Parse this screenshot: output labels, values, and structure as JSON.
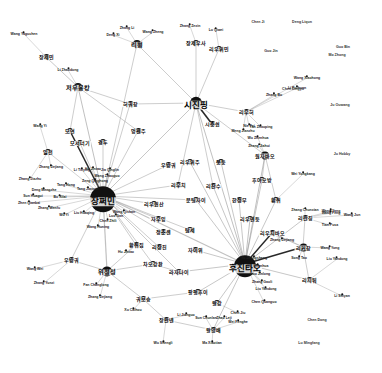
{
  "figure": {
    "type": "network-graph",
    "title": "",
    "background_color": "#ffffff",
    "node_color": "#111111",
    "edge_color": "#9a9a9a",
    "strong_edge_color": "#111111",
    "width": 382,
    "height": 373
  },
  "nodes": [
    {
      "id": "jiang_zemin",
      "label": "장쩌민",
      "x": 103,
      "y": 196,
      "r": 13,
      "tier": "hub"
    },
    {
      "id": "hu_jintao",
      "label": "후진타오",
      "x": 245,
      "y": 264,
      "r": 11,
      "tier": "hub"
    },
    {
      "id": "xi_jinping",
      "label": "시진핑",
      "x": 196,
      "y": 103,
      "r": 6,
      "tier": "hub"
    },
    {
      "id": "zhou_yongkang",
      "label": "저우융캉",
      "x": 78,
      "y": 87,
      "r": 4,
      "tier": "mid"
    },
    {
      "id": "yu_zhengsheng",
      "label": "위정성",
      "x": 107,
      "y": 271,
      "r": 5,
      "tier": "mid"
    },
    {
      "id": "li_peng",
      "label": "리펑",
      "x": 137,
      "y": 44,
      "r": 4,
      "tier": "mid"
    },
    {
      "id": "zhang_jiemin",
      "label": "장제민",
      "x": 46,
      "y": 57,
      "r": 3,
      "tier": "small"
    },
    {
      "id": "jang_jeo_usa",
      "label": "장제우사",
      "x": 196,
      "y": 43,
      "r": 3,
      "tier": "small"
    },
    {
      "id": "liu_yumin",
      "label": "리우위민",
      "x": 219,
      "y": 49,
      "r": 3,
      "tier": "small"
    },
    {
      "id": "heo_gwochang",
      "label": "허궈창",
      "x": 130,
      "y": 104,
      "r": 3,
      "tier": "small"
    },
    {
      "id": "meng_jianzhu",
      "label": "멍젠주",
      "x": 138,
      "y": 131,
      "r": 3,
      "tier": "small"
    },
    {
      "id": "liu_yunhe",
      "label": "리우허",
      "x": 246,
      "y": 112,
      "r": 3,
      "tier": "small"
    },
    {
      "id": "xi_zhongxun",
      "label": "시중쉰",
      "x": 212,
      "y": 124,
      "r": 3,
      "tier": "small"
    },
    {
      "id": "wu_bangguo_c",
      "label": "우방궈",
      "x": 168,
      "y": 165,
      "r": 3,
      "tier": "small"
    },
    {
      "id": "liu_yuzhou",
      "label": "리우위주",
      "x": 190,
      "y": 162,
      "r": 3,
      "tier": "small"
    },
    {
      "id": "jong_dong",
      "label": "쭝둥",
      "x": 221,
      "y": 162,
      "r": 3,
      "tier": "small"
    },
    {
      "id": "wen_jiabao",
      "label": "원자바오",
      "x": 265,
      "y": 155,
      "r": 4,
      "tier": "small"
    },
    {
      "id": "liu_qi",
      "label": "리우치",
      "x": 178,
      "y": 185,
      "r": 3,
      "tier": "small"
    },
    {
      "id": "li_zhanshu",
      "label": "리잔수",
      "x": 213,
      "y": 186,
      "r": 3,
      "tier": "small"
    },
    {
      "id": "hu_yaobang",
      "label": "후야오방",
      "x": 262,
      "y": 180,
      "r": 3,
      "tier": "small"
    },
    {
      "id": "han_zhengbu",
      "label": "한정부",
      "x": 239,
      "y": 200,
      "r": 3,
      "tier": "small"
    },
    {
      "id": "huang_ju_r",
      "label": "황쥐",
      "x": 276,
      "y": 200,
      "r": 3,
      "tier": "small"
    },
    {
      "id": "wen_tingjai",
      "label": "문팅자이",
      "x": 196,
      "y": 200,
      "r": 3,
      "tier": "small"
    },
    {
      "id": "liu_yunshan_l",
      "label": "리우윈산",
      "x": 154,
      "y": 204,
      "r": 3,
      "tier": "small"
    },
    {
      "id": "ja_uyang",
      "label": "자우잉",
      "x": 158,
      "y": 219,
      "r": 3,
      "tier": "small"
    },
    {
      "id": "liu_yandong",
      "label": "리우옌둥",
      "x": 250,
      "y": 219,
      "r": 3,
      "tier": "small"
    },
    {
      "id": "li_lanqing",
      "label": "리란칭",
      "x": 305,
      "y": 218,
      "r": 3,
      "tier": "small"
    },
    {
      "id": "liu_qibao",
      "label": "리우치바오",
      "x": 272,
      "y": 233,
      "r": 3,
      "tier": "small"
    },
    {
      "id": "li_keqiang",
      "label": "리커창",
      "x": 303,
      "y": 247,
      "r": 4,
      "tier": "small"
    },
    {
      "id": "jeong_chunsaeng",
      "label": "정춘셴",
      "x": 163,
      "y": 232,
      "r": 3,
      "tier": "small"
    },
    {
      "id": "dang_se",
      "label": "탐세",
      "x": 190,
      "y": 230,
      "r": 3,
      "tier": "small"
    },
    {
      "id": "li_jangchin",
      "label": "리장친",
      "x": 159,
      "y": 247,
      "r": 3,
      "tier": "small"
    },
    {
      "id": "ja_ieo",
      "label": "자이위",
      "x": 195,
      "y": 250,
      "r": 3,
      "tier": "small"
    },
    {
      "id": "huang_ju_jip",
      "label": "황쥐집",
      "x": 136,
      "y": 245,
      "r": 3,
      "tier": "small"
    },
    {
      "id": "wu_bangwei",
      "label": "우방궈",
      "x": 71,
      "y": 260,
      "r": 3,
      "tier": "small"
    },
    {
      "id": "jao_gangchuan",
      "label": "차오강촨",
      "x": 153,
      "y": 264,
      "r": 3,
      "tier": "small"
    },
    {
      "id": "lajanai",
      "label": "라자나이",
      "x": 179,
      "y": 272,
      "r": 3,
      "tier": "small"
    },
    {
      "id": "li_jitao",
      "label": "리지퉈",
      "x": 309,
      "y": 280,
      "r": 3,
      "tier": "small"
    },
    {
      "id": "guo_boxiong",
      "label": "궈보슝",
      "x": 143,
      "y": 299,
      "r": 3,
      "tier": "small"
    },
    {
      "id": "fang_fenghui",
      "label": "팡펑후이",
      "x": 198,
      "y": 292,
      "r": 3,
      "tier": "small"
    },
    {
      "id": "wang_gang",
      "label": "왕강",
      "x": 217,
      "y": 303,
      "r": 3,
      "tier": "small"
    },
    {
      "id": "zhang_wannian",
      "label": "장완녠",
      "x": 166,
      "y": 320,
      "r": 3,
      "tier": "small"
    },
    {
      "id": "wang_yangbae",
      "label": "왕양배",
      "x": 213,
      "y": 330,
      "r": 3,
      "tier": "small"
    },
    {
      "id": "il_cheon",
      "label": "일천",
      "x": 48,
      "y": 152,
      "r": 3,
      "tier": "small"
    },
    {
      "id": "moyeon",
      "label": "모연",
      "x": 70,
      "y": 131,
      "r": 3,
      "tier": "small"
    },
    {
      "id": "moseoneogi",
      "label": "모서너기",
      "x": 80,
      "y": 143,
      "r": 3,
      "tier": "small"
    },
    {
      "id": "gyeongdu",
      "label": "경두",
      "x": 103,
      "y": 142,
      "r": 3,
      "tier": "small"
    }
  ],
  "leaf_labels": [
    {
      "label": "Wang Yaguchen",
      "x": 24,
      "y": 34
    },
    {
      "label": "Li Zhaodong",
      "x": 68,
      "y": 70
    },
    {
      "label": "Wang Yi",
      "x": 40,
      "y": 126
    },
    {
      "label": "Zhang Dejiang",
      "x": 51,
      "y": 167
    },
    {
      "label": "Zhang Jiazhu",
      "x": 30,
      "y": 179
    },
    {
      "label": "Tang Hong",
      "x": 66,
      "y": 185
    },
    {
      "label": "Deng Mengzhe",
      "x": 44,
      "y": 190
    },
    {
      "label": "Sun Huagui",
      "x": 33,
      "y": 196
    },
    {
      "label": "Zhen Qianbai",
      "x": 29,
      "y": 203
    },
    {
      "label": "Bo Xilai",
      "x": 60,
      "y": 197
    },
    {
      "label": "Zhang Wenfu",
      "x": 49,
      "y": 208
    },
    {
      "label": "Wu Yi",
      "x": 64,
      "y": 215
    },
    {
      "label": "Liu Huaqing",
      "x": 84,
      "y": 213
    },
    {
      "label": "Tang Jiaxuan",
      "x": 88,
      "y": 189
    },
    {
      "label": "Zeng Qinghong",
      "x": 95,
      "y": 181
    },
    {
      "label": "Hu Jintao",
      "x": 93,
      "y": 169
    },
    {
      "label": "Li Tieying",
      "x": 82,
      "y": 170
    },
    {
      "label": "Wang Zhaoguo",
      "x": 107,
      "y": 176
    },
    {
      "label": "Jia Qinglin",
      "x": 110,
      "y": 170
    },
    {
      "label": "Chen Zhili",
      "x": 108,
      "y": 221
    },
    {
      "label": "Wang Huning",
      "x": 98,
      "y": 227
    },
    {
      "label": "Luo Gan",
      "x": 116,
      "y": 216
    },
    {
      "label": "Wang Qishan",
      "x": 124,
      "y": 212
    },
    {
      "label": "Hu Jintao",
      "x": 126,
      "y": 252
    },
    {
      "label": "Wang Wei",
      "x": 35,
      "y": 269
    },
    {
      "label": "Zhang Yunzi",
      "x": 44,
      "y": 283
    },
    {
      "label": "Fan Changlong",
      "x": 96,
      "y": 285
    },
    {
      "label": "Zhang Dejiang",
      "x": 100,
      "y": 297
    },
    {
      "label": "Xu Caihou",
      "x": 133,
      "y": 310
    },
    {
      "label": "Wu Shengli",
      "x": 163,
      "y": 343
    },
    {
      "label": "Ma Xiaotian",
      "x": 212,
      "y": 343
    },
    {
      "label": "Wei Fenghe",
      "x": 238,
      "y": 322
    },
    {
      "label": "Chen Jiu",
      "x": 238,
      "y": 313
    },
    {
      "label": "Zhao Leji",
      "x": 224,
      "y": 318
    },
    {
      "label": "Sun Chunlan",
      "x": 206,
      "y": 318
    },
    {
      "label": "Li Jianguo",
      "x": 186,
      "y": 315
    },
    {
      "label": "Chen Quanguo",
      "x": 264,
      "y": 302
    },
    {
      "label": "Liu Yandong",
      "x": 266,
      "y": 289
    },
    {
      "label": "Zhang Gaoli",
      "x": 262,
      "y": 282
    },
    {
      "label": "Guo Jinlong",
      "x": 260,
      "y": 274
    },
    {
      "label": "Hu Chunhua",
      "x": 258,
      "y": 266
    },
    {
      "label": "Yu Zhengsheng",
      "x": 254,
      "y": 258
    },
    {
      "label": "Zhang Dejiang",
      "x": 282,
      "y": 240
    },
    {
      "label": "Zhang Chunxian",
      "x": 305,
      "y": 210
    },
    {
      "label": "Wang Yang",
      "x": 331,
      "y": 211
    },
    {
      "label": "Meng Jianzhu",
      "x": 243,
      "y": 131
    },
    {
      "label": "Wu Zhenhua",
      "x": 258,
      "y": 138
    },
    {
      "label": "Zhang Jiahui",
      "x": 259,
      "y": 146
    },
    {
      "label": "Nie Fei",
      "x": 249,
      "y": 126
    },
    {
      "label": "Yan Zhaoping",
      "x": 261,
      "y": 127
    },
    {
      "label": "Wei Yongkang",
      "x": 303,
      "y": 174
    },
    {
      "label": "Wang Yong",
      "x": 330,
      "y": 248
    },
    {
      "label": "Liu Yandong",
      "x": 337,
      "y": 259
    },
    {
      "label": "Wang Feng",
      "x": 331,
      "y": 213
    },
    {
      "label": "Wang Jun",
      "x": 352,
      "y": 215
    },
    {
      "label": "Tian Pusa",
      "x": 330,
      "y": 225
    },
    {
      "label": "Li Shiyan",
      "x": 342,
      "y": 296
    },
    {
      "label": "Song Tao",
      "x": 299,
      "y": 258
    },
    {
      "label": "Zhang Bo",
      "x": 274,
      "y": 95
    },
    {
      "label": "Zhang Zexin",
      "x": 190,
      "y": 26
    },
    {
      "label": "Zhang Li",
      "x": 127,
      "y": 28
    },
    {
      "label": "Deng Xi",
      "x": 113,
      "y": 35
    },
    {
      "label": "Wang Zheng",
      "x": 153,
      "y": 32
    },
    {
      "label": "Lu Qiwei",
      "x": 216,
      "y": 30
    },
    {
      "label": "Wang Xiaohong",
      "x": 307,
      "y": 78
    },
    {
      "label": "Li Ruihuan",
      "x": 297,
      "y": 88
    }
  ],
  "isolated_nodes": [
    {
      "label": "Chen Ji",
      "x": 258,
      "y": 23
    },
    {
      "label": "Deng Liqun",
      "x": 302,
      "y": 23
    },
    {
      "label": "Guo Jin",
      "x": 271,
      "y": 52
    },
    {
      "label": "Chen Lingyu",
      "x": 293,
      "y": 90
    },
    {
      "label": "Ju Ouwang",
      "x": 340,
      "y": 106
    },
    {
      "label": "Ju Hobby",
      "x": 342,
      "y": 155
    },
    {
      "label": "Chen Dong",
      "x": 317,
      "y": 321
    },
    {
      "label": "Lu Mingfang",
      "x": 309,
      "y": 344
    },
    {
      "label": "Guo Bin",
      "x": 343,
      "y": 48
    },
    {
      "label": "Mo Zhong",
      "x": 337,
      "y": 56
    }
  ],
  "edges": [
    {
      "from": "jiang_zemin",
      "to": "hu_jintao",
      "w": 1.1
    },
    {
      "from": "jiang_zemin",
      "to": "xi_jinping",
      "w": 0.9
    },
    {
      "from": "jiang_zemin",
      "to": "zhou_yongkang",
      "w": 1
    },
    {
      "from": "jiang_zemin",
      "to": "yu_zhengsheng",
      "w": 1.2
    },
    {
      "from": "jiang_zemin",
      "to": "heo_gwochang",
      "w": 0.8
    },
    {
      "from": "jiang_zemin",
      "to": "meng_jianzhu",
      "w": 0.8
    },
    {
      "from": "jiang_zemin",
      "to": "li_peng",
      "w": 0.8
    },
    {
      "from": "jiang_zemin",
      "to": "gyeongdu",
      "w": 0.8
    },
    {
      "from": "jiang_zemin",
      "to": "moseoneogi",
      "w": 0.8
    },
    {
      "from": "jiang_zemin",
      "to": "moyeon",
      "w": 1.5
    },
    {
      "from": "jiang_zemin",
      "to": "il_cheon",
      "w": 0.7
    },
    {
      "from": "jiang_zemin",
      "to": "wu_bangguo_c",
      "w": 0.8
    },
    {
      "from": "jiang_zemin",
      "to": "liu_qi",
      "w": 0.8
    },
    {
      "from": "jiang_zemin",
      "to": "liu_yunshan_l",
      "w": 0.8
    },
    {
      "from": "jiang_zemin",
      "to": "ja_uyang",
      "w": 0.8
    },
    {
      "from": "jiang_zemin",
      "to": "jeong_chunsaeng",
      "w": 0.8
    },
    {
      "from": "jiang_zemin",
      "to": "li_jangchin",
      "w": 0.8
    },
    {
      "from": "jiang_zemin",
      "to": "huang_ju_jip",
      "w": 0.8
    },
    {
      "from": "jiang_zemin",
      "to": "jao_gangchuan",
      "w": 0.8
    },
    {
      "from": "jiang_zemin",
      "to": "wen_tingjai",
      "w": 0.8
    },
    {
      "from": "jiang_zemin",
      "to": "dang_se",
      "w": 0.8
    },
    {
      "from": "jiang_zemin",
      "to": "lajanai",
      "w": 0.8
    },
    {
      "from": "jiang_zemin",
      "to": "wu_bangwei",
      "w": 0.8
    },
    {
      "from": "hu_jintao",
      "to": "xi_jinping",
      "w": 1
    },
    {
      "from": "hu_jintao",
      "to": "wen_jiabao",
      "w": 1
    },
    {
      "from": "hu_jintao",
      "to": "hu_yaobang",
      "w": 0.9
    },
    {
      "from": "hu_jintao",
      "to": "han_zhengbu",
      "w": 0.9
    },
    {
      "from": "hu_jintao",
      "to": "huang_ju_r",
      "w": 0.9
    },
    {
      "from": "hu_jintao",
      "to": "liu_yandong",
      "w": 1
    },
    {
      "from": "hu_jintao",
      "to": "liu_qibao",
      "w": 1.4
    },
    {
      "from": "hu_jintao",
      "to": "li_keqiang",
      "w": 1.4
    },
    {
      "from": "hu_jintao",
      "to": "li_lanqing",
      "w": 0.9
    },
    {
      "from": "hu_jintao",
      "to": "li_zhanshu",
      "w": 0.9
    },
    {
      "from": "hu_jintao",
      "to": "jong_dong",
      "w": 0.9
    },
    {
      "from": "hu_jintao",
      "to": "liu_yuzhou",
      "w": 0.9
    },
    {
      "from": "hu_jintao",
      "to": "wen_tingjai",
      "w": 0.9
    },
    {
      "from": "hu_jintao",
      "to": "ja_ieo",
      "w": 0.9
    },
    {
      "from": "hu_jintao",
      "to": "wang_gang",
      "w": 0.9
    },
    {
      "from": "hu_jintao",
      "to": "fang_fenghui",
      "w": 0.9
    },
    {
      "from": "hu_jintao",
      "to": "li_jitao",
      "w": 0.9
    },
    {
      "from": "hu_jintao",
      "to": "wang_yangbae",
      "w": 0.9
    },
    {
      "from": "hu_jintao",
      "to": "lajanai",
      "w": 0.9
    },
    {
      "from": "xi_jinping",
      "to": "xi_zhongxun",
      "w": 1.6
    },
    {
      "from": "xi_jinping",
      "to": "liu_yunhe",
      "w": 0.8
    },
    {
      "from": "xi_jinping",
      "to": "jang_jeo_usa",
      "w": 0.8
    },
    {
      "from": "xi_jinping",
      "to": "liu_yumin",
      "w": 0.8
    },
    {
      "from": "xi_jinping",
      "to": "li_peng",
      "w": 0.8
    },
    {
      "from": "xi_jinping",
      "to": "heo_gwochang",
      "w": 0.8
    },
    {
      "from": "xi_jinping",
      "to": "wen_jiabao",
      "w": 0.8
    },
    {
      "from": "xi_jinping",
      "to": "liu_qi",
      "w": 0.8
    },
    {
      "from": "xi_jinping",
      "to": "li_zhanshu",
      "w": 0.8
    },
    {
      "from": "zhou_yongkang",
      "to": "zhang_jiemin",
      "w": 0.9
    },
    {
      "from": "zhou_yongkang",
      "to": "heo_gwochang",
      "w": 0.8
    },
    {
      "from": "zhou_yongkang",
      "to": "meng_jianzhu",
      "w": 0.8
    },
    {
      "from": "zhou_yongkang",
      "to": "moyeon",
      "w": 0.8
    },
    {
      "from": "yu_zhengsheng",
      "to": "huang_ju_jip",
      "w": 0.8
    },
    {
      "from": "yu_zhengsheng",
      "to": "wu_bangwei",
      "w": 0.8
    },
    {
      "from": "yu_zhengsheng",
      "to": "jao_gangchuan",
      "w": 0.8
    },
    {
      "from": "yu_zhengsheng",
      "to": "guo_boxiong",
      "w": 0.8
    },
    {
      "from": "guo_boxiong",
      "to": "zhang_wannian",
      "w": 0.8
    },
    {
      "from": "guo_boxiong",
      "to": "fang_fenghui",
      "w": 0.8
    },
    {
      "from": "zhang_wannian",
      "to": "wang_yangbae",
      "w": 0.8
    },
    {
      "from": "jao_gangchuan",
      "to": "lajanai",
      "w": 0.8
    },
    {
      "from": "li_keqiang",
      "to": "li_jitao",
      "w": 0.8
    },
    {
      "from": "li_keqiang",
      "to": "liu_qibao",
      "w": 1.2
    },
    {
      "from": "li_lanqing",
      "to": "li_keqiang",
      "w": 0.8
    },
    {
      "from": "wen_jiabao",
      "to": "hu_yaobang",
      "w": 0.8
    },
    {
      "from": "wen_jiabao",
      "to": "huang_ju_r",
      "w": 0.8
    }
  ]
}
